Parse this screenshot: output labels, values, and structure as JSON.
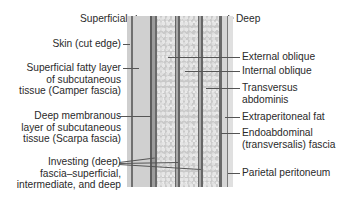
{
  "direction": {
    "superficial": "Superficial",
    "deep": "Deep"
  },
  "labels_left": {
    "skin": "Skin (cut edge)",
    "camper": [
      "Superficial fatty layer",
      "of subcutaneous",
      "tissue (Camper fascia)"
    ],
    "scarpa": [
      "Deep membranous",
      "layer of subcutaneous",
      "tissue (Scarpa fascia)"
    ],
    "investing": [
      "Investing (deep)",
      "fascia–superficial,",
      "intermediate, and deep"
    ]
  },
  "labels_right": {
    "external_oblique": "External oblique",
    "internal_oblique": "Internal oblique",
    "transversus": [
      "Transversus",
      "abdominis"
    ],
    "extraperitoneal_fat": "Extraperitoneal fat",
    "endoabdominal": [
      "Endoabdominal",
      "(transversalis) fascia"
    ],
    "parietal_peritoneum": "Parietal peritoneum"
  },
  "colors": {
    "light_layer": "#d2d2d2",
    "dark_line": "#6a6a6a",
    "mid_band": "#9a9a9a",
    "muscle_base": "#c9c9c9",
    "text": "#2a2a2a"
  }
}
